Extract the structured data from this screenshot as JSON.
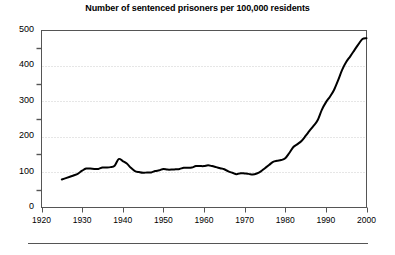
{
  "chart_data": {
    "type": "line",
    "title": "Number of sentenced prisoners per 100,000 residents",
    "xlabel": "",
    "ylabel": "",
    "xlim": [
      1920,
      2000
    ],
    "ylim": [
      0,
      500
    ],
    "grid": "horizontal-dotted",
    "legend": "none",
    "y_ticks": [
      0,
      100,
      200,
      300,
      400,
      500
    ],
    "y_minor_ticks": [
      50,
      150,
      250,
      350,
      450
    ],
    "x_ticks": [
      1920,
      1930,
      1940,
      1950,
      1960,
      1970,
      1980,
      1990,
      2000
    ],
    "x": [
      1925,
      1926,
      1927,
      1928,
      1929,
      1930,
      1931,
      1932,
      1933,
      1934,
      1935,
      1936,
      1937,
      1938,
      1939,
      1940,
      1941,
      1942,
      1943,
      1944,
      1945,
      1946,
      1947,
      1948,
      1949,
      1950,
      1951,
      1952,
      1953,
      1954,
      1955,
      1956,
      1957,
      1958,
      1959,
      1960,
      1961,
      1962,
      1963,
      1964,
      1965,
      1966,
      1967,
      1968,
      1969,
      1970,
      1971,
      1972,
      1973,
      1974,
      1975,
      1976,
      1977,
      1978,
      1979,
      1980,
      1981,
      1982,
      1983,
      1984,
      1985,
      1986,
      1987,
      1988,
      1989,
      1990,
      1991,
      1992,
      1993,
      1994,
      1995,
      1996,
      1997,
      1998,
      1999,
      2000
    ],
    "values": [
      79,
      83,
      87,
      91,
      96,
      104,
      110,
      110,
      109,
      109,
      113,
      113,
      114,
      118,
      137,
      131,
      124,
      112,
      103,
      100,
      98,
      99,
      99,
      103,
      105,
      109,
      107,
      107,
      108,
      109,
      112,
      112,
      113,
      117,
      117,
      117,
      119,
      117,
      114,
      111,
      108,
      102,
      98,
      94,
      97,
      96,
      95,
      93,
      96,
      102,
      111,
      120,
      129,
      132,
      134,
      139,
      154,
      171,
      179,
      188,
      202,
      217,
      231,
      247,
      276,
      297,
      313,
      332,
      359,
      389,
      411,
      427,
      444,
      461,
      476,
      478
    ],
    "series_name": "sentenced prisoners per 100,000 residents",
    "line_color": "#000000",
    "line_width": 2,
    "grid_color": "#cccccc",
    "axis_color": "#555555",
    "background": "#ffffff"
  },
  "axes": {
    "y_labels": [
      "500",
      "400",
      "300",
      "200",
      "100",
      "0"
    ],
    "x_labels": [
      "1920",
      "1930",
      "1940",
      "1950",
      "1960",
      "1970",
      "1980",
      "1990",
      "2000"
    ]
  }
}
